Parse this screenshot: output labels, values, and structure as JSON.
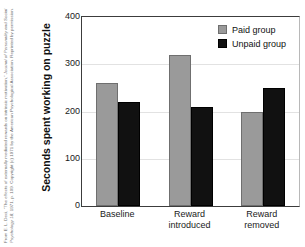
{
  "caption": {
    "text_part1": "From E. L. Deci, “The effects of externally mediated rewards on intrinsic motivation,” ",
    "text_italic": "Journal of Personality and Social Psychology 18",
    "text_part2": ", 1971, p. 109. Copyright (c) 1971 by the American Psychological Association. Reprinted by permission."
  },
  "legend": {
    "position": "inside-top-right",
    "entries": [
      {
        "label": "Paid group",
        "color": "#9a9a9a",
        "swatch": "paid"
      },
      {
        "label": "Unpaid group",
        "color": "#111111",
        "swatch": "unpaid"
      }
    ]
  },
  "chart_data": {
    "type": "bar",
    "title": "",
    "subtitle": "",
    "xlabel": "",
    "ylabel": "Seconds spent working on puzzle",
    "categories": [
      "Baseline",
      "Reward introduced",
      "Reward removed"
    ],
    "category_lines": [
      [
        "Baseline"
      ],
      [
        "Reward",
        "introduced"
      ],
      [
        "Reward",
        "removed"
      ]
    ],
    "series": [
      {
        "name": "Paid group",
        "color": "#9a9a9a",
        "values": [
          260,
          320,
          200
        ]
      },
      {
        "name": "Unpaid group",
        "color": "#111111",
        "values": [
          220,
          210,
          250
        ]
      }
    ],
    "ylim": [
      0,
      400
    ],
    "yticks": [
      0,
      100,
      200,
      300,
      400
    ],
    "ytick_labels": [
      "0",
      "100",
      "200",
      "300",
      "400"
    ],
    "grid": "horizontal",
    "grid_color": "#e2e2e2",
    "legend_position": "upper right"
  }
}
